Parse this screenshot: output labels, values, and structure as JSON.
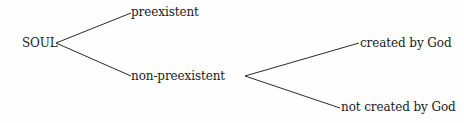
{
  "diagram": {
    "type": "tree",
    "root": {
      "label": "SOUL",
      "children": [
        {
          "label": "preexistent",
          "children": []
        },
        {
          "label": "non-preexistent",
          "children": [
            {
              "label": "created by God",
              "children": []
            },
            {
              "label": "not created by God",
              "children": []
            }
          ]
        }
      ]
    },
    "nodes": {
      "soul": "SOUL",
      "preexistent": "preexistent",
      "non_preexistent": "non-preexistent",
      "created_by_god": "created by God",
      "not_created_by_god": "not created by God"
    },
    "colors": {
      "background": "#fefefe",
      "line": "#2a2a2a",
      "text": "#1a1a1a"
    }
  }
}
